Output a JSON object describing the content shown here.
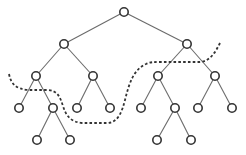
{
  "diagram": {
    "type": "binary-tree",
    "colors": {
      "node_stroke": "#333333",
      "edge": "#6a6a6a",
      "cut_line": "#333333",
      "background": "#ffffff"
    },
    "node_radius": 4.2,
    "nodes": [
      {
        "id": "n0",
        "x": 124,
        "y": 12
      },
      {
        "id": "n1",
        "x": 64,
        "y": 44
      },
      {
        "id": "n2",
        "x": 187,
        "y": 44
      },
      {
        "id": "n3",
        "x": 36,
        "y": 76
      },
      {
        "id": "n4",
        "x": 93,
        "y": 76
      },
      {
        "id": "n5",
        "x": 158,
        "y": 76
      },
      {
        "id": "n6",
        "x": 215,
        "y": 76
      },
      {
        "id": "n7",
        "x": 19,
        "y": 108
      },
      {
        "id": "n8",
        "x": 53,
        "y": 108
      },
      {
        "id": "n9",
        "x": 77,
        "y": 108
      },
      {
        "id": "n10",
        "x": 110,
        "y": 108
      },
      {
        "id": "n11",
        "x": 141,
        "y": 108
      },
      {
        "id": "n12",
        "x": 175,
        "y": 108
      },
      {
        "id": "n13",
        "x": 198,
        "y": 108
      },
      {
        "id": "n14",
        "x": 232,
        "y": 108
      },
      {
        "id": "n15",
        "x": 37,
        "y": 140
      },
      {
        "id": "n16",
        "x": 70,
        "y": 140
      },
      {
        "id": "n17",
        "x": 157,
        "y": 140
      },
      {
        "id": "n18",
        "x": 191,
        "y": 140
      }
    ],
    "edges": [
      [
        "n0",
        "n1"
      ],
      [
        "n0",
        "n2"
      ],
      [
        "n1",
        "n3"
      ],
      [
        "n1",
        "n4"
      ],
      [
        "n2",
        "n5"
      ],
      [
        "n2",
        "n6"
      ],
      [
        "n3",
        "n7"
      ],
      [
        "n3",
        "n8"
      ],
      [
        "n4",
        "n9"
      ],
      [
        "n4",
        "n10"
      ],
      [
        "n5",
        "n11"
      ],
      [
        "n5",
        "n12"
      ],
      [
        "n6",
        "n13"
      ],
      [
        "n6",
        "n14"
      ],
      [
        "n8",
        "n15"
      ],
      [
        "n8",
        "n16"
      ],
      [
        "n12",
        "n17"
      ],
      [
        "n12",
        "n18"
      ]
    ],
    "cut_line": {
      "style": "dashed",
      "path": "M 9 74 C 11 84, 16 89, 28 90 L 48 90 C 58 91, 60 97, 63 106 C 66 116, 71 122, 82 123 L 108 123 C 118 122, 122 112, 125 100 C 129 84, 133 70, 146 64 C 150 62, 154 62, 160 62 L 200 62 C 210 61, 215 53, 220 43"
    }
  }
}
